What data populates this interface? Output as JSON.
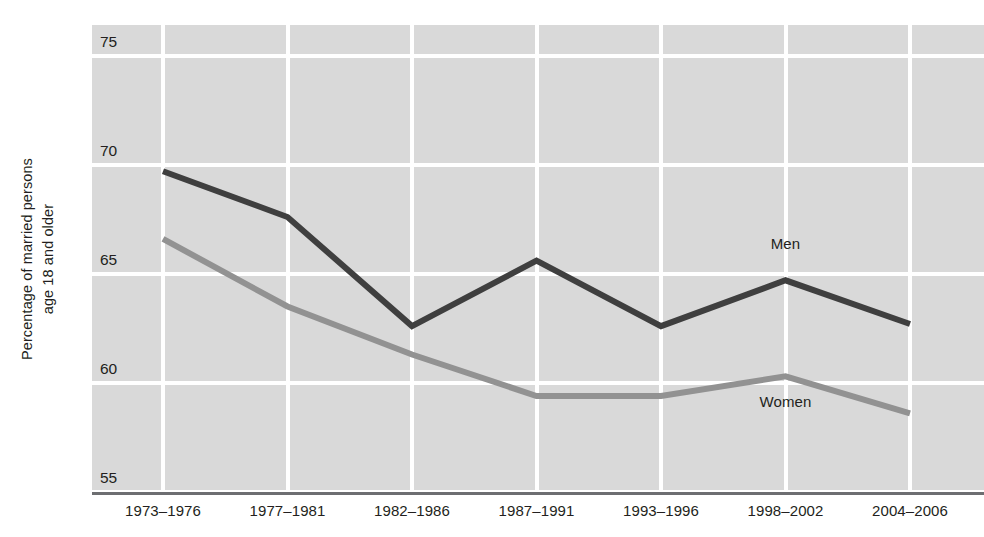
{
  "chart_data": {
    "type": "line",
    "title": "",
    "xlabel": "",
    "ylabel": "Percentage of married persons age 18 and older",
    "ylabel_lines": [
      "Percentage of married persons",
      "age 18 and older"
    ],
    "categories": [
      "1973–1976",
      "1977–1981",
      "1982–1986",
      "1987–1991",
      "1993–1996",
      "1998–2002",
      "2004–2006"
    ],
    "ylim": [
      55,
      76.4
    ],
    "yticks": [
      55,
      60,
      65,
      70,
      75
    ],
    "grid": true,
    "legend_position": "inline-annotation",
    "series": [
      {
        "name": "Men",
        "color": "#3f3f3f",
        "values": [
          69.7,
          67.6,
          62.6,
          65.6,
          62.6,
          64.7,
          62.7
        ],
        "annotation": {
          "label": "Men",
          "x_index": 5,
          "value": 66.3
        }
      },
      {
        "name": "Women",
        "color": "#929292",
        "values": [
          66.6,
          63.5,
          61.3,
          59.4,
          59.4,
          60.3,
          58.6
        ],
        "annotation": {
          "label": "Women",
          "x_index": 5,
          "value": 59.1
        }
      }
    ]
  },
  "colors": {
    "plot_background": "#d9d9d9",
    "gridline": "#ffffff",
    "axis": "#6d6e71",
    "text": "#231f20",
    "men_line": "#3f3f3f",
    "women_line": "#929292"
  }
}
